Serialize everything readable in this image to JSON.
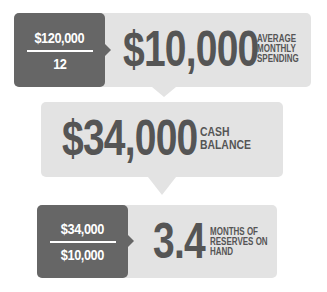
{
  "colors": {
    "dark_box": "#666666",
    "light_box": "#e3e3e3",
    "text_dark": "#555555",
    "text_light": "#ffffff"
  },
  "step1": {
    "numerator": "$120,000",
    "denominator": "12",
    "result": "$10,000",
    "caption_lines": [
      "AVERAGE",
      "MONTHLY",
      "SPENDING"
    ]
  },
  "step2": {
    "result": "$34,000",
    "caption_lines": [
      "CASH",
      "BALANCE"
    ]
  },
  "step3": {
    "numerator": "$34,000",
    "denominator": "$10,000",
    "result": "3.4",
    "caption_lines": [
      "MONTHS OF",
      "RESERVES ON",
      "HAND"
    ]
  }
}
